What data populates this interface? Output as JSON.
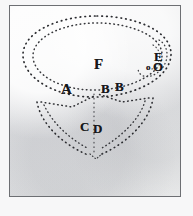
{
  "figure": {
    "kind": "engraved-plate",
    "caption": "",
    "paper_color": "#e9eaec",
    "frame_color": "#6d6f73",
    "ink_color": "#17181a",
    "line_style": "dotted",
    "labels": [
      {
        "id": "label-A",
        "text": "A",
        "x": 60,
        "y": 82,
        "size": "lg"
      },
      {
        "id": "label-B1",
        "text": "B",
        "x": 100,
        "y": 82,
        "size": "md"
      },
      {
        "id": "label-B2",
        "text": "B",
        "x": 114,
        "y": 80,
        "size": "md"
      },
      {
        "id": "label-C",
        "text": "C",
        "x": 79,
        "y": 120,
        "size": "md"
      },
      {
        "id": "label-D",
        "text": "D",
        "x": 92,
        "y": 122,
        "size": "md"
      },
      {
        "id": "label-E",
        "text": "E",
        "x": 153,
        "y": 50,
        "size": "md"
      },
      {
        "id": "label-F",
        "text": "F",
        "x": 93,
        "y": 58,
        "size": "lg"
      },
      {
        "id": "label-O",
        "text": "O",
        "x": 152,
        "y": 60,
        "size": "md"
      },
      {
        "id": "label-o",
        "text": "o",
        "x": 145,
        "y": 62,
        "size": "sm"
      }
    ],
    "shapes": {
      "outer_ellipse": {
        "cx": 96,
        "cy": 57,
        "rx": 75,
        "ry": 42
      },
      "inner_ellipse": {
        "cx": 96,
        "cy": 57,
        "rx": 66,
        "ry": 34
      },
      "funnel_apex": {
        "x": 92,
        "y": 152
      },
      "funnel_left_junction": {
        "x": 40,
        "y": 104
      },
      "funnel_right_junction": {
        "x": 143,
        "y": 102
      }
    }
  }
}
